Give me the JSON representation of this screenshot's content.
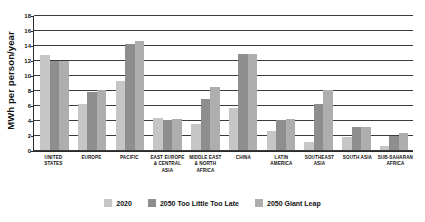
{
  "chart_data": {
    "type": "bar",
    "title": "",
    "xlabel": "",
    "ylabel": "MWh per person/year",
    "ylim": [
      0,
      18
    ],
    "yticks": [
      0,
      2,
      4,
      6,
      8,
      10,
      12,
      14,
      16,
      18
    ],
    "grid": true,
    "legend_position": "bottom",
    "categories": [
      "UNITED STATES",
      "EUROPE",
      "PACIFIC",
      "EAST EUROPE & CENTRAL ASIA",
      "MIDDLE EAST & NORTH AFRICA",
      "CHINA",
      "LATIN AMERICA",
      "SOUTHEAST ASIA",
      "SOUTH ASIA",
      "SUB-SAHARAN AFRICA"
    ],
    "series": [
      {
        "name": "2020",
        "color": "#c6c6c6",
        "values": [
          12.7,
          6.2,
          9.2,
          4.2,
          3.4,
          5.6,
          2.5,
          1.0,
          1.75,
          0.5
        ]
      },
      {
        "name": "2050 Too Little Too Late",
        "color": "#8e8e8e",
        "values": [
          12.0,
          7.8,
          14.2,
          4.0,
          6.8,
          12.9,
          4.0,
          6.1,
          3.05,
          1.9
        ]
      },
      {
        "name": "2050 Giant Leap",
        "color": "#aeaeae",
        "values": [
          12.0,
          8.0,
          14.6,
          4.1,
          8.4,
          12.9,
          4.1,
          8.1,
          3.05,
          2.2
        ]
      }
    ]
  }
}
